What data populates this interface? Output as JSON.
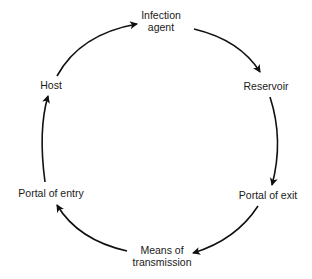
{
  "diagram": {
    "type": "cycle",
    "stroke_color": "#111111",
    "nodes": [
      {
        "id": "infection-agent",
        "line1": "Infection",
        "line2": "agent"
      },
      {
        "id": "reservoir",
        "line1": "Reservoir"
      },
      {
        "id": "portal-of-exit",
        "line1": "Portal of exit"
      },
      {
        "id": "means-of-transmission",
        "line1": "Means of",
        "line2": "transmission"
      },
      {
        "id": "portal-of-entry",
        "line1": "Portal of entry"
      },
      {
        "id": "host",
        "line1": "Host"
      }
    ],
    "edges": [
      {
        "from": "infection-agent",
        "to": "reservoir"
      },
      {
        "from": "reservoir",
        "to": "portal-of-exit"
      },
      {
        "from": "portal-of-exit",
        "to": "means-of-transmission"
      },
      {
        "from": "means-of-transmission",
        "to": "portal-of-entry"
      },
      {
        "from": "portal-of-entry",
        "to": "host"
      },
      {
        "from": "host",
        "to": "infection-agent"
      }
    ]
  }
}
